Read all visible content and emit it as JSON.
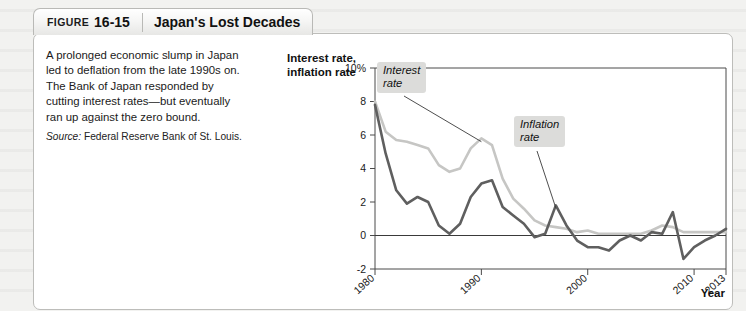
{
  "figure": {
    "tab_label": "FIGURE",
    "tab_number": "16-15",
    "title": "Japan's Lost Decades"
  },
  "caption": {
    "text": "A prolonged economic slump in Japan led to deflation from the late 1990s on. The Bank of Japan responded by cutting interest rates—but eventually ran up against the zero bound.",
    "source_label": "Source:",
    "source_text": " Federal Reserve Bank of St. Louis."
  },
  "chart_data": {
    "type": "line",
    "title": "Japan's Lost Decades",
    "xlabel": "Year",
    "ylabel": "Interest rate, inflation rate",
    "xlim": [
      1980,
      2013
    ],
    "ylim": [
      -2,
      10
    ],
    "y_ticks": [
      "-2",
      "0",
      "2",
      "4",
      "6",
      "8",
      "10%"
    ],
    "y_tick_values": [
      -2,
      0,
      2,
      4,
      6,
      8,
      10
    ],
    "x_ticks": [
      "1980",
      "1990",
      "2000",
      "2010",
      "2013"
    ],
    "x_tick_values": [
      1980,
      1990,
      2000,
      2010,
      2013
    ],
    "grid": false,
    "zero_line": true,
    "legend_position": "inline-annotations",
    "series": [
      {
        "name": "Interest rate",
        "color": "#c6c6c4",
        "x": [
          1980,
          1981,
          1982,
          1983,
          1984,
          1985,
          1986,
          1987,
          1988,
          1989,
          1990,
          1991,
          1992,
          1993,
          1994,
          1995,
          1996,
          1997,
          1998,
          1999,
          2000,
          2001,
          2002,
          2003,
          2004,
          2005,
          2006,
          2007,
          2008,
          2009,
          2010,
          2011,
          2012,
          2013
        ],
        "values": [
          8.0,
          6.2,
          5.7,
          5.6,
          5.4,
          5.2,
          4.2,
          3.8,
          4.0,
          5.2,
          5.8,
          5.4,
          3.4,
          2.2,
          1.6,
          0.9,
          0.6,
          0.5,
          0.4,
          0.2,
          0.3,
          0.1,
          0.1,
          0.1,
          0.1,
          0.1,
          0.3,
          0.6,
          0.5,
          0.2,
          0.2,
          0.2,
          0.2,
          0.2
        ]
      },
      {
        "name": "Inflation rate",
        "color": "#5f5f5f",
        "x": [
          1980,
          1981,
          1982,
          1983,
          1984,
          1985,
          1986,
          1987,
          1988,
          1989,
          1990,
          1991,
          1992,
          1993,
          1994,
          1995,
          1996,
          1997,
          1998,
          1999,
          2000,
          2001,
          2002,
          2003,
          2004,
          2005,
          2006,
          2007,
          2008,
          2009,
          2010,
          2011,
          2012,
          2013
        ],
        "values": [
          7.8,
          4.9,
          2.7,
          1.9,
          2.3,
          2.0,
          0.6,
          0.1,
          0.7,
          2.3,
          3.1,
          3.3,
          1.7,
          1.2,
          0.7,
          -0.1,
          0.1,
          1.8,
          0.6,
          -0.3,
          -0.7,
          -0.7,
          -0.9,
          -0.3,
          0.0,
          -0.3,
          0.2,
          0.1,
          1.4,
          -1.4,
          -0.7,
          -0.3,
          0.0,
          0.4
        ]
      }
    ],
    "annotations": [
      {
        "name": "Interest rate",
        "label_line1": "Interest",
        "label_line2": "rate"
      },
      {
        "name": "Inflation rate",
        "label_line1": "Inflation",
        "label_line2": "rate"
      }
    ]
  }
}
